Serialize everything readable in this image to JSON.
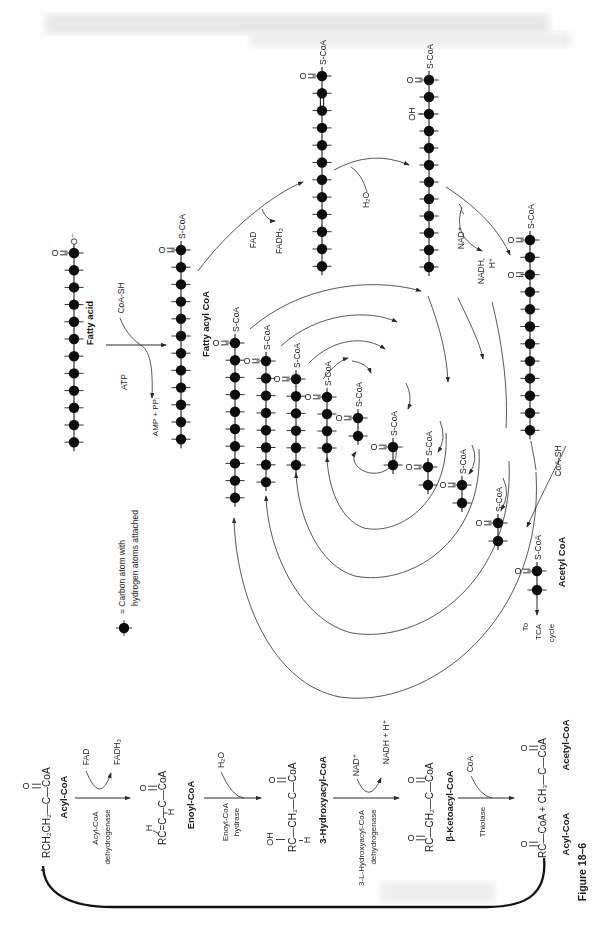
{
  "figure": {
    "caption": "Figure 18–6"
  },
  "legend": {
    "line1": "= Carbon atom with",
    "line2": "hydrogen atoms attached"
  },
  "symbols": {
    "s_coa": "S-CoA",
    "o": "O",
    "o_minus": "O⁻",
    "oh": "OH"
  },
  "overview": {
    "fatty_acid": "Fatty acid",
    "coa_sh": "CoA-SH",
    "atp": "ATP",
    "amp_ppi": "AMP + PPᵢ",
    "fatty_acyl_coa": "Fatty acyl CoA",
    "fad": "FAD",
    "fadh2": "FADH₂",
    "h2o": "H₂O",
    "nad_plus": "NAD⁺",
    "nadh": "NADH,",
    "h_plus": "H⁺",
    "coa_sh_release": "CoA-SH",
    "acetyl_coa": "Acetyl CoA",
    "to_tca_line1": "To",
    "to_tca_line2": "TCA",
    "to_tca_line3": "cycle"
  },
  "pathway": {
    "step1": {
      "formula": "RCH₂CH₂—C—CoA",
      "o": "O",
      "label": "Acyl-CoA",
      "enzyme_line1": "Acyl-CoA",
      "enzyme_line2": "dehydrogenase",
      "cofactor_in": "FAD",
      "cofactor_out": "FADH₂"
    },
    "step2": {
      "formula": "RC=C—C—CoA",
      "h_alpha": "H",
      "h_beta": "H",
      "o": "O",
      "label": "Enoyl-CoA",
      "enzyme_line1": "Enoyl-CoA",
      "enzyme_line2": "hydrase",
      "cofactor_in": "H₂O"
    },
    "step3": {
      "formula": "RC—CH₂—C—CoA",
      "oh": "OH",
      "h": "H",
      "o": "O",
      "label": "3-Hydroxyacyl-CoA",
      "enzyme_line1": "3-L-Hydroxyacyl-CoA",
      "enzyme_line2": "dehydrogenase",
      "cofactor_in": "NAD⁺",
      "cofactor_out": "NADH + H⁺"
    },
    "step4": {
      "formula": "RC—CH₂—C—CoA",
      "o_top": "O",
      "o_bottom": "O",
      "label": "β-Ketoacyl-CoA",
      "enzyme": "Thiolase",
      "cofactor_in": "CoA"
    },
    "step5": {
      "formula": "RC—CoA + CH₃—C—CoA",
      "o_acyl": "O",
      "o_acetyl": "O",
      "label_acyl": "Acyl-CoA",
      "label_acetyl": "Acetyl-CoA"
    }
  },
  "chains": [
    {
      "name": "fatty-acid-chain",
      "x": 74,
      "y1": 253,
      "n": 12,
      "sp": 17.2,
      "o1": true,
      "topO": true
    },
    {
      "name": "fatty-acyl-coa-chain",
      "x": 181,
      "y1": 250,
      "n": 12,
      "sp": 17.2,
      "o1": true,
      "scoa": true
    },
    {
      "name": "enoyl-coa-chain",
      "x": 322,
      "y1": 76,
      "n": 12,
      "sp": 17.3,
      "o1": true,
      "scoa": true,
      "db23": true
    },
    {
      "name": "hydroxyacyl-coa-chain",
      "x": 429,
      "y1": 80,
      "n": 12,
      "sp": 17.0,
      "o1": true,
      "scoa": true,
      "oh3": true
    },
    {
      "name": "ketoacyl-coa-chain",
      "x": 530,
      "y1": 240,
      "n": 12,
      "sp": 17.3,
      "o1": true,
      "scoa": true,
      "o3": true
    },
    {
      "name": "acyl-c10-chain",
      "x": 235,
      "y1": 343,
      "n": 10,
      "sp": 17.2,
      "o1": true,
      "scoa": true
    },
    {
      "name": "acyl-c8-chain",
      "x": 266,
      "y1": 361,
      "n": 8,
      "sp": 17.3,
      "o1": true,
      "scoa": true
    },
    {
      "name": "acyl-c6-chain",
      "x": 296,
      "y1": 379,
      "n": 6,
      "sp": 17.2,
      "o1": true,
      "scoa": true
    },
    {
      "name": "acyl-c4-chain",
      "x": 327,
      "y1": 397,
      "n": 4,
      "sp": 17.0,
      "o1": true,
      "scoa": true
    },
    {
      "name": "acetyl-unit-1",
      "x": 358,
      "y1": 418,
      "n": 2,
      "sp": 18,
      "o1": true,
      "scoa": true
    },
    {
      "name": "acetyl-unit-2",
      "x": 393,
      "y1": 447,
      "n": 2,
      "sp": 18,
      "o1": true,
      "scoa": true
    },
    {
      "name": "acetyl-unit-3",
      "x": 428,
      "y1": 467,
      "n": 2,
      "sp": 18,
      "o1": true,
      "scoa": true
    },
    {
      "name": "acetyl-unit-4",
      "x": 462,
      "y1": 485,
      "n": 2,
      "sp": 18,
      "o1": true,
      "scoa": true
    },
    {
      "name": "acetyl-unit-5",
      "x": 498,
      "y1": 523,
      "n": 2,
      "sp": 18,
      "o1": true,
      "scoa": true
    },
    {
      "name": "acetyl-coa-final",
      "x": 537,
      "y1": 571,
      "n": 2,
      "sp": 19,
      "o1": true,
      "scoa": true
    }
  ]
}
